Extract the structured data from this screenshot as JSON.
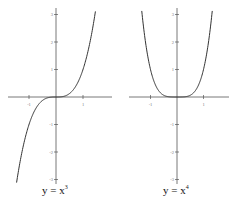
{
  "chart_data": [
    {
      "type": "line",
      "title": "y = x^3",
      "caption_base": "y = x",
      "caption_exp": "3",
      "function": "x^3",
      "xlim": [
        -2.0,
        2.1
      ],
      "ylim": [
        -3.3,
        3.2
      ],
      "xticks": [
        -1,
        1
      ],
      "yticks": [
        -3,
        -2,
        -1,
        1,
        2,
        3
      ],
      "xtick_labels": [
        "-1",
        "1"
      ],
      "ytick_labels": [
        "-3",
        "-2",
        "-1",
        "1",
        "2",
        "3"
      ],
      "grid": false,
      "points": [
        [
          -1.45,
          -3.05
        ],
        [
          -1.25,
          -1.95
        ],
        [
          -1.0,
          -1.0
        ],
        [
          -0.75,
          -0.42
        ],
        [
          -0.5,
          -0.125
        ],
        [
          0,
          0
        ],
        [
          0.5,
          0.125
        ],
        [
          0.75,
          0.42
        ],
        [
          1.0,
          1.0
        ],
        [
          1.25,
          1.95
        ],
        [
          1.45,
          3.05
        ]
      ]
    },
    {
      "type": "line",
      "title": "y = x^4",
      "caption_base": "y = x",
      "caption_exp": "4",
      "function": "x^4",
      "xlim": [
        -2.0,
        2.1
      ],
      "ylim": [
        -3.3,
        3.2
      ],
      "xticks": [
        -1,
        1
      ],
      "yticks": [
        -3,
        -2,
        -1,
        1,
        2,
        3
      ],
      "xtick_labels": [
        "-1",
        "1"
      ],
      "ytick_labels": [
        "-3",
        "-2",
        "-1",
        "1",
        "2",
        "3"
      ],
      "grid": false,
      "points": [
        [
          -1.32,
          3.03
        ],
        [
          -1.2,
          2.07
        ],
        [
          -1.0,
          1.0
        ],
        [
          -0.75,
          0.32
        ],
        [
          -0.5,
          0.06
        ],
        [
          0,
          0
        ],
        [
          0.5,
          0.06
        ],
        [
          0.75,
          0.32
        ],
        [
          1.0,
          1.0
        ],
        [
          1.2,
          2.07
        ],
        [
          1.32,
          3.03
        ]
      ]
    }
  ],
  "colors": {
    "axis": "#555555",
    "curve": "#333333",
    "text": "#111111"
  }
}
